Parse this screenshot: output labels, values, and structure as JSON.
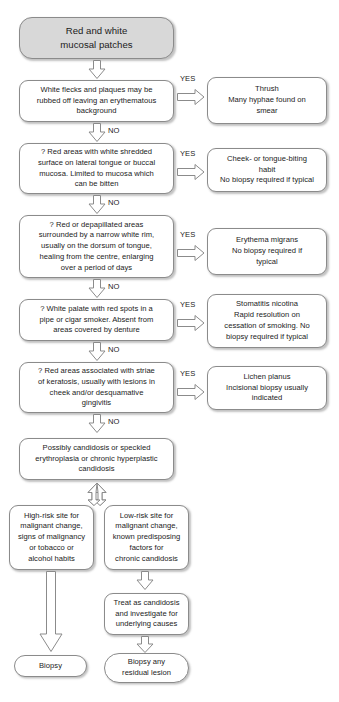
{
  "diagram": {
    "stroke_color": "#8b8b8b",
    "start_fill": "#d8d8d8",
    "background": "#ffffff"
  },
  "labels": {
    "yes": "YES",
    "no": "NO"
  },
  "nodes": {
    "start": "Red and white mucosal patches",
    "q1": "White flecks and plaques may be rubbed off leaving an erythematous background",
    "a1": "Thrush Many hyphae found on smear",
    "q2": "? Red areas with white shredded surface on lateral tongue or buccal mucosa. Limited to mucosa which can be bitten",
    "a2": "Cheek- or tongue-biting habit No biopsy required if typical",
    "q3": "? Red or depapillated areas surrounded by a narrow white rim, usually on the dorsum of tongue, healing from the centre, enlarging over a period of days",
    "a3": "Erythema migrans No biopsy required if typical",
    "q4": "? White palate with red spots in a pipe or cigar smoker. Absent from areas covered by denture",
    "a4": "Stomatitis nicotina Rapid resolution on cessation of smoking. No biopsy required if typical",
    "q5": "? Red areas associated with striae of keratosis, usually with lesions in cheek and/or desquamative gingivitis",
    "a5": "Lichen planus Incisional biopsy usually indicated",
    "outcome": "Possibly candidosis or speckled erythroplasia or chronic hyperplastic candidosis",
    "branch_left": "High-risk site for malignant change, signs of malignancy or tobacco or alcohol habits",
    "branch_right": "Low-risk site for malignant change, known predisposing factors for chronic candidosis",
    "treat": "Treat as candidosis and investigate for underlying causes",
    "biopsy": "Biopsy",
    "biopsy_residual": "Biopsy any residual lesion"
  },
  "node_lines": {
    "start": [
      "Red and white",
      "mucosal patches"
    ],
    "q1": [
      "White flecks and plaques may be",
      "rubbed off leaving an erythematous",
      "background"
    ],
    "a1": [
      "Thrush",
      "Many hyphae found on",
      "smear"
    ],
    "q2": [
      "? Red areas with white shredded",
      "surface on lateral tongue or buccal",
      "mucosa. Limited to mucosa which",
      "can be bitten"
    ],
    "a2": [
      "Cheek- or tongue-biting",
      "habit",
      "No biopsy required if typical"
    ],
    "q3": [
      "? Red or depapillated areas",
      "surrounded by a narrow white rim,",
      "usually on the dorsum of tongue,",
      "healing from the centre, enlarging",
      "over a period of days"
    ],
    "a3": [
      "Erythema migrans",
      "No biopsy required if",
      "typical"
    ],
    "q4": [
      "? White palate with red spots in a",
      "pipe or cigar smoker. Absent from",
      "areas covered by denture"
    ],
    "a4": [
      "Stomatitis nicotina",
      "Rapid resolution on",
      "cessation of smoking. No",
      "biopsy required if typical"
    ],
    "q5": [
      "? Red areas associated with striae",
      "of keratosis, usually with lesions in",
      "cheek and/or desquamative",
      "gingivitis"
    ],
    "a5": [
      "Lichen planus",
      "Incisional biopsy usually",
      "indicated"
    ],
    "outcome": [
      "Possibly candidosis or speckled",
      "erythroplasia or chronic hyperplastic",
      "candidosis"
    ],
    "branch_left": [
      "High-risk site for",
      "malignant change,",
      "signs of malignancy",
      "or tobacco or",
      "alcohol habits"
    ],
    "branch_right": [
      "Low-risk site for",
      "malignant change,",
      "known predisposing",
      "factors for",
      "chronic candidosis"
    ],
    "treat": [
      "Treat as candidosis",
      "and investigate for",
      "underlying causes"
    ],
    "biopsy": [
      "Biopsy"
    ],
    "biopsy_residual": [
      "Biopsy any",
      "residual lesion"
    ]
  }
}
